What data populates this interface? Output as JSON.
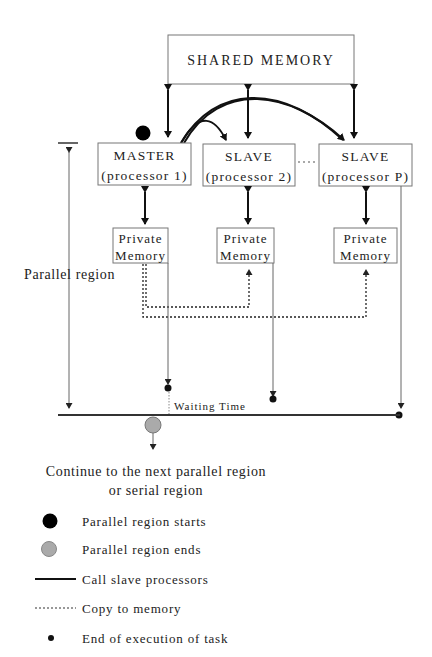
{
  "diagram": {
    "shared_memory": {
      "label": "SHARED MEMORY"
    },
    "processors": [
      {
        "role": "MASTER",
        "name": "(processor 1)"
      },
      {
        "role": "SLAVE",
        "name": "(processor 2)"
      },
      {
        "role": "SLAVE",
        "name": "(processor P)"
      }
    ],
    "ellipsis": "....",
    "private_memories": [
      {
        "line1": "Private",
        "line2": "Memory"
      },
      {
        "line1": "Private",
        "line2": "Memory"
      },
      {
        "line1": "Private",
        "line2": "Memory"
      }
    ],
    "parallel_region_label": "Parallel region",
    "waiting_time_label": "Waiting Time",
    "continue_label_line1": "Continue to the next parallel region",
    "continue_label_line2": "or serial region",
    "colors": {
      "start_marker": "#000000",
      "end_marker": "#aaaaaa",
      "line": "#111111"
    }
  },
  "legend": [
    {
      "symbol": "black-circle",
      "label": "Parallel region starts"
    },
    {
      "symbol": "gray-circle",
      "label": "Parallel region ends"
    },
    {
      "symbol": "solid-line",
      "label": "Call slave processors"
    },
    {
      "symbol": "dotted-line",
      "label": "Copy to memory"
    },
    {
      "symbol": "small-dot",
      "label": "End of execution of task"
    }
  ]
}
